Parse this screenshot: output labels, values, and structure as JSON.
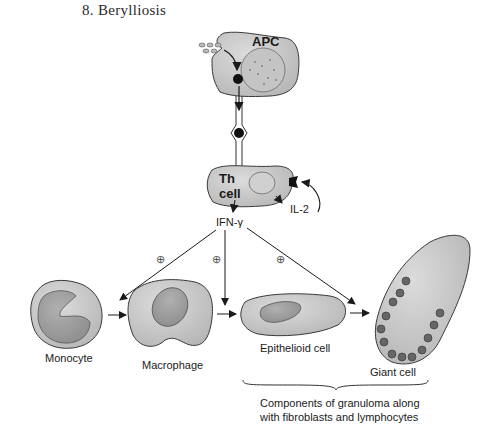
{
  "title": "8.  Berylliosis",
  "labels": {
    "apc": "APC",
    "th_cell_line1": "Th",
    "th_cell_line2": "cell",
    "il2": "IL-2",
    "ifn": "IFN-γ",
    "plus": "⊕",
    "monocyte": "Monocyte",
    "macrophage": "Macrophage",
    "epithelioid": "Epithelioid cell",
    "giant": "Giant cell",
    "caption_line1": "Components of granuloma along",
    "caption_line2": "with fibroblasts and lymphocytes"
  },
  "colors": {
    "cell_fill": "#c8c8c8",
    "nucleus_fill": "#a9a9a9",
    "outline": "#3a3a3a",
    "arrow": "#1a1a1a"
  }
}
